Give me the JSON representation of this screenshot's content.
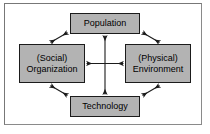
{
  "diagram": {
    "frame": {
      "border_color": "#8a8a8a",
      "background_color": "#ffffff"
    },
    "node_style": {
      "fill_color": "#b3b3b3",
      "border_color": "#1b1b1b",
      "text_color": "#000000"
    },
    "arrow_color": "#1b1b1b",
    "nodes": [
      {
        "id": "population",
        "label": "Population",
        "position": "top"
      },
      {
        "id": "social-organization",
        "label": "(Social)\nOrganization",
        "position": "left"
      },
      {
        "id": "physical-environment",
        "label": "(Physical)\nEnvironment",
        "position": "right"
      },
      {
        "id": "technology",
        "label": "Technology",
        "position": "bottom"
      }
    ],
    "connections": [
      {
        "id": "population-technology",
        "from": "population",
        "to": "technology",
        "style": "double-headed-arrow",
        "orientation": "vertical"
      },
      {
        "id": "social-organization-physical-environment",
        "from": "social-organization",
        "to": "physical-environment",
        "style": "double-headed-arrow",
        "orientation": "horizontal"
      },
      {
        "id": "population-social-organization",
        "from": "population",
        "to": "social-organization",
        "style": "double-headed-arrow",
        "orientation": "diagonal-top-left"
      },
      {
        "id": "population-physical-environment",
        "from": "population",
        "to": "physical-environment",
        "style": "double-headed-arrow",
        "orientation": "diagonal-top-right"
      },
      {
        "id": "social-organization-technology",
        "from": "social-organization",
        "to": "technology",
        "style": "double-headed-arrow",
        "orientation": "diagonal-bottom-left"
      },
      {
        "id": "physical-environment-technology",
        "from": "physical-environment",
        "to": "technology",
        "style": "double-headed-arrow",
        "orientation": "diagonal-bottom-right"
      }
    ]
  }
}
